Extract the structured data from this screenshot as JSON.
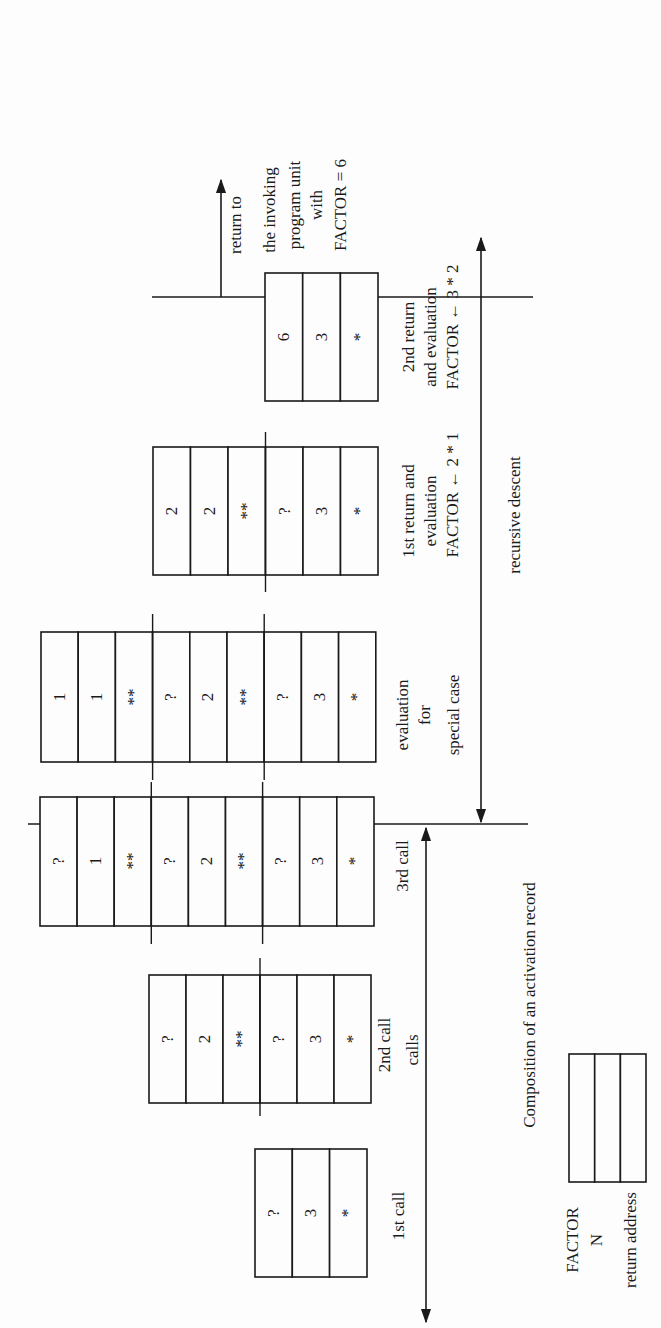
{
  "figure": {
    "orientation": "rotated-90-ccw",
    "phases": {
      "calls_label": "calls",
      "descent_label": "recursive descent"
    },
    "return_note": {
      "lines": [
        "return to",
        "the invoking",
        "program unit",
        "with",
        "FACTOR = 6"
      ]
    },
    "stages": [
      {
        "id": "1st-call",
        "label_lines": [
          "1st call"
        ],
        "records": [
          [
            "?",
            "3",
            "*"
          ]
        ]
      },
      {
        "id": "2nd-call",
        "label_lines": [
          "2nd call"
        ],
        "records": [
          [
            "?",
            "2",
            "**"
          ],
          [
            "?",
            "3",
            "*"
          ]
        ]
      },
      {
        "id": "3rd-call",
        "label_lines": [
          "3rd call"
        ],
        "records": [
          [
            "?",
            "1",
            "**"
          ],
          [
            "?",
            "2",
            "**"
          ],
          [
            "?",
            "3",
            "*"
          ]
        ]
      },
      {
        "id": "special-case",
        "label_lines": [
          "evaluation",
          "for",
          "special case"
        ],
        "records": [
          [
            "1",
            "1",
            "**"
          ],
          [
            "?",
            "2",
            "**"
          ],
          [
            "?",
            "3",
            "*"
          ]
        ]
      },
      {
        "id": "1st-return",
        "label_lines": [
          "1st return and",
          "evaluation",
          "FACTOR ← 2 * 1"
        ],
        "records": [
          [
            "2",
            "2",
            "**"
          ],
          [
            "?",
            "3",
            "*"
          ]
        ]
      },
      {
        "id": "2nd-return",
        "label_lines": [
          "2nd return",
          "and evaluation",
          "FACTOR ← 3 * 2"
        ],
        "records": [
          [
            "6",
            "3",
            "*"
          ]
        ]
      }
    ],
    "legend": {
      "title": "Composition of an activation record",
      "fields": [
        "FACTOR",
        "N",
        "return address"
      ]
    },
    "colors": {
      "ink": "#1a1a1a",
      "paper": "#fdfdfd"
    }
  }
}
